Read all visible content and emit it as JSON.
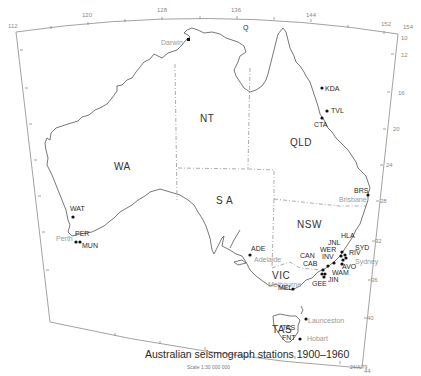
{
  "map": {
    "title": "Australian seismograph stations 1900–1960",
    "scale": "Scale 1:30 000 000",
    "reference": "24/A/79",
    "longitude_ticks": [
      "112",
      "120",
      "128",
      "136",
      "144",
      "152",
      "154"
    ],
    "latitude_ticks": [
      "10",
      "12",
      "16",
      "20",
      "24",
      "28",
      "32",
      "36",
      "40",
      "44"
    ],
    "states": [
      "WA",
      "NT",
      "QLD",
      "S A",
      "NSW",
      "VIC",
      "TAS"
    ],
    "small_labels": [
      "Q"
    ],
    "cities": [
      "Darwin",
      "Brisbane",
      "Sydney",
      "Adelaide",
      "Melbourne",
      "Perth",
      "Launceston",
      "Hobart"
    ],
    "stations": [
      "KDA",
      "TVL",
      "CTA",
      "BRS",
      "HLA",
      "JNL",
      "SYD",
      "RIV",
      "WER",
      "INV",
      "CAN",
      "AVO",
      "CAB",
      "WAM",
      "JIN",
      "GEE",
      "MEL",
      "ADE",
      "WAT",
      "PER",
      "MUN",
      "TAS",
      "FNT"
    ]
  }
}
